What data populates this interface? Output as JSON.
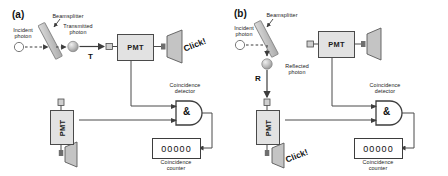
{
  "figure": {
    "type": "physics-apparatus-diagram",
    "colors": {
      "line": "#4a4a4a",
      "box_fill": "#e2e2e2",
      "beamsplitter_fill": "#c9c9c9",
      "photon_fill": "#b9b9b9",
      "speaker_fill": "#c4c4c4",
      "text": "#1a1a1a",
      "background": "#ffffff"
    }
  },
  "panels": [
    {
      "id": "a",
      "tag": "(a)",
      "labels": {
        "incident_photon": "Incident\nphoton",
        "beamsplitter": "Beamsplitter",
        "outgoing_photon": "Transmitted\nphoton",
        "path_symbol": "T",
        "pmt_top": "PMT",
        "pmt_side": "PMT",
        "click": "Click!",
        "coincidence_detector": "Coincidence\ndetector",
        "gate_symbol": "&",
        "counter_value": "00000",
        "coincidence_counter": "Coincidence\ncounter"
      }
    },
    {
      "id": "b",
      "tag": "(b)",
      "labels": {
        "incident_photon": "Incident\nphoton",
        "beamsplitter": "Beamsplitter",
        "outgoing_photon": "Reflected\nphoton",
        "path_symbol": "R",
        "pmt_top": "PMT",
        "pmt_side": "PMT",
        "click": "Click!",
        "coincidence_detector": "Coincidence\ndetector",
        "gate_symbol": "&",
        "counter_value": "00000",
        "coincidence_counter": "Coincidence\ncounter"
      }
    }
  ]
}
